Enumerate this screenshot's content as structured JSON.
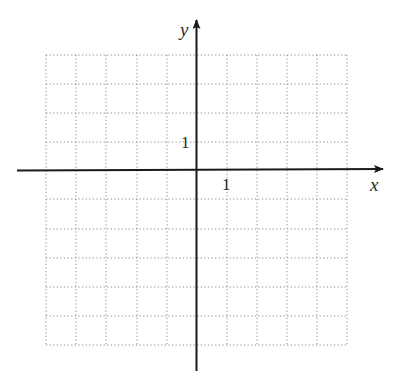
{
  "diagram": {
    "type": "coordinate-grid",
    "axes": {
      "x_label": "x",
      "y_label": "y",
      "x_tick_label": "1",
      "y_tick_label": "1"
    },
    "grid": {
      "columns_left_of_origin": 5,
      "columns_right_of_origin": 5,
      "rows_above_origin": 4,
      "rows_below_origin": 6,
      "unit": 1,
      "style": "dotted"
    },
    "colors": {
      "axis": "#1a1a1a",
      "grid": "#8a8a8a",
      "text": "#2a2a2a"
    }
  }
}
